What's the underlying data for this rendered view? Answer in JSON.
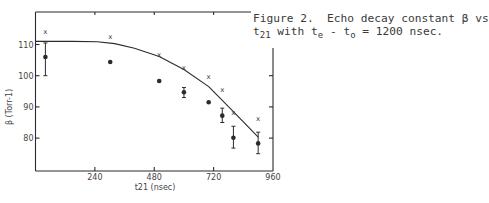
{
  "caption": {
    "line1": "Figure 2.  Echo decay constant β vs",
    "line2_prefix": "t",
    "line2_sub1": "21",
    "line2_mid1": " with t",
    "line2_sub2": "e",
    "line2_mid2": " - t",
    "line2_sub3": "o",
    "line2_suffix": " = 1200 nsec."
  },
  "colors": {
    "ink": "#2b2b2b",
    "background": "#ffffff"
  },
  "chart_data": {
    "type": "scatter",
    "title": "Figure 2. Echo decay constant β vs t21 with te - to = 1200 nsec.",
    "xlabel": "t21 (nsec)",
    "ylabel": "β (Torr-1)",
    "xlim": [
      0,
      960
    ],
    "ylim": [
      74,
      118
    ],
    "x_ticks": [
      240,
      480,
      720,
      960
    ],
    "x_tick_labels": [
      "240",
      "480",
      "720",
      "960"
    ],
    "y_ticks": [
      80,
      90,
      100,
      110
    ],
    "y_tick_labels": [
      "80",
      "90",
      "100",
      "110"
    ],
    "grid": false,
    "legend": null,
    "series": [
      {
        "name": "measured (dots with error bars)",
        "marker": "filled-circle",
        "points": [
          {
            "x": 40,
            "y": 106.0,
            "err_low": 100.0,
            "err_high": 110.5
          },
          {
            "x": 302,
            "y": 104.4
          },
          {
            "x": 500,
            "y": 98.3
          },
          {
            "x": 600,
            "y": 94.7,
            "err_low": 93.0,
            "err_high": 96.2
          },
          {
            "x": 700,
            "y": 91.5
          },
          {
            "x": 755,
            "y": 87.2,
            "err_low": 85.0,
            "err_high": 89.6
          },
          {
            "x": 800,
            "y": 80.1,
            "err_low": 76.8,
            "err_high": 83.8
          },
          {
            "x": 900,
            "y": 78.3,
            "err_low": 75.0,
            "err_high": 81.9
          }
        ]
      },
      {
        "name": "crosses",
        "marker": "x",
        "points": [
          {
            "x": 40,
            "y": 114.3
          },
          {
            "x": 302,
            "y": 112.7
          },
          {
            "x": 500,
            "y": 106.9
          },
          {
            "x": 600,
            "y": 102.7
          },
          {
            "x": 700,
            "y": 99.7
          },
          {
            "x": 755,
            "y": 95.6
          },
          {
            "x": 800,
            "y": 88.3
          },
          {
            "x": 900,
            "y": 86.3
          }
        ]
      },
      {
        "name": "theory curve",
        "marker": "line",
        "points": [
          {
            "x": 0,
            "y": 111.0
          },
          {
            "x": 150,
            "y": 111.0
          },
          {
            "x": 250,
            "y": 110.9
          },
          {
            "x": 320,
            "y": 110.3
          },
          {
            "x": 400,
            "y": 108.8
          },
          {
            "x": 500,
            "y": 106.2
          },
          {
            "x": 600,
            "y": 102.0
          },
          {
            "x": 700,
            "y": 96.5
          },
          {
            "x": 800,
            "y": 88.5
          },
          {
            "x": 900,
            "y": 80.3
          }
        ]
      }
    ]
  }
}
